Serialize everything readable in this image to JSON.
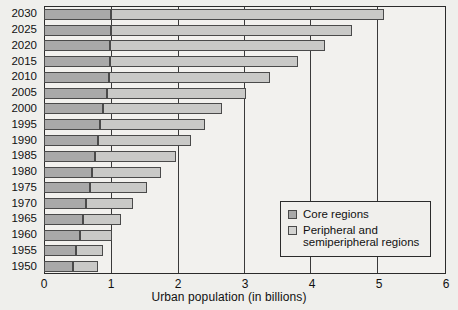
{
  "chart_data": {
    "type": "bar",
    "orientation": "horizontal",
    "stacked": true,
    "title": "",
    "xlabel": "Urban population (in billions)",
    "ylabel": "",
    "xlim": [
      0,
      6
    ],
    "xticks": [
      0,
      1,
      2,
      3,
      4,
      5,
      6
    ],
    "xtick_labels": [
      "0",
      "1",
      "2",
      "3",
      "4",
      "5",
      "6"
    ],
    "grid": true,
    "grid_axis": "x",
    "legend_position": "lower right",
    "categories": [
      "2030",
      "2025",
      "2020",
      "2015",
      "2010",
      "2005",
      "2000",
      "1995",
      "1990",
      "1985",
      "1980",
      "1975",
      "1970",
      "1965",
      "1960",
      "1955",
      "1950"
    ],
    "series": [
      {
        "name": "Core regions",
        "color": "#a9a9a9",
        "values": [
          1.0,
          1.0,
          0.99,
          0.99,
          0.97,
          0.94,
          0.88,
          0.84,
          0.8,
          0.76,
          0.72,
          0.68,
          0.63,
          0.58,
          0.53,
          0.48,
          0.44
        ]
      },
      {
        "name": "Peripheral and semiperipheral regions",
        "color": "#c9c9c7",
        "values": [
          4.07,
          3.6,
          3.21,
          2.8,
          2.41,
          2.07,
          1.78,
          1.57,
          1.39,
          1.21,
          1.03,
          0.86,
          0.7,
          0.57,
          0.48,
          0.4,
          0.36
        ]
      }
    ],
    "totals": [
      5.07,
      4.6,
      4.2,
      3.79,
      3.38,
      3.01,
      2.66,
      2.41,
      2.19,
      1.97,
      1.75,
      1.54,
      1.33,
      1.15,
      1.01,
      0.88,
      0.8
    ]
  },
  "axis": {
    "x_title": "Urban population (in billions)",
    "x_tick_labels": [
      "0",
      "1",
      "2",
      "3",
      "4",
      "5",
      "6"
    ],
    "y_tick_labels": [
      "2030",
      "2025",
      "2020",
      "2015",
      "2010",
      "2005",
      "2000",
      "1995",
      "1990",
      "1985",
      "1980",
      "1975",
      "1970",
      "1965",
      "1960",
      "1955",
      "1950"
    ]
  },
  "legend": {
    "items": [
      {
        "label": "Core regions",
        "swatch": "core-swatch",
        "color": "#a9a9a9"
      },
      {
        "label": "Peripheral and semiperipheral regions",
        "label_line1": "Peripheral and",
        "label_line2": "semiperipheral regions",
        "swatch": "peripheral-swatch",
        "color": "#d3d3d1"
      }
    ]
  }
}
